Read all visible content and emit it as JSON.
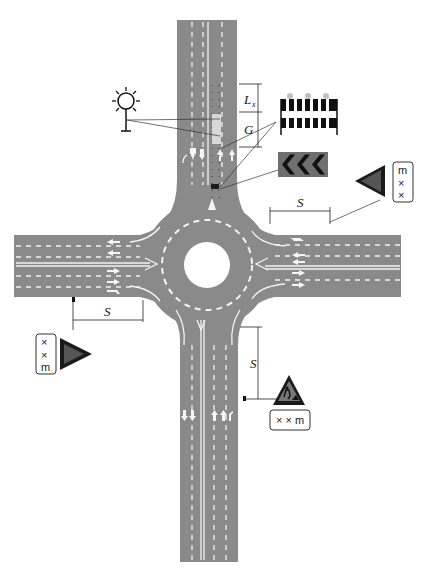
{
  "diagram": {
    "type": "roundabout-work-zone-layout",
    "labels": {
      "s_top_right": "S",
      "s_left": "S",
      "s_bottom": "S",
      "lx": "L",
      "lx_sub": "x",
      "g": "G"
    },
    "signs": {
      "right_plate": [
        "m",
        "×",
        "×"
      ],
      "left_plate": [
        "×",
        "×",
        "m"
      ],
      "bottom_plate": "× × m",
      "bottom_plate_chars": [
        "×",
        "×",
        "m"
      ]
    },
    "icons": {
      "warning_light": "warning-light-icon",
      "barrier": "road-barrier-icon",
      "chevron_board": "chevron-direction-board-icon",
      "roadwork_sign": "roadwork-warning-sign-icon"
    },
    "colors": {
      "road": "#8a8a8a",
      "marking": "#f4f4f4",
      "sign_black": "#1a1a1a",
      "chevron_bg": "#6f6f6f",
      "barrier_light": "#c0c0c0"
    }
  }
}
